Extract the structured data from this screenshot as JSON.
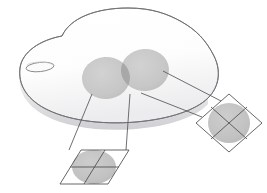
{
  "figure": {
    "background_color": "#ffffff",
    "width": 267,
    "height": 193
  },
  "colors": {
    "background": "#ffffff",
    "outline": "#6f6f72",
    "leader_line": "#55555a",
    "patch_fill": "#c9c9c9",
    "patch_overlap_fill": "#a8a8a8",
    "inset_circle_fill": "#c4c4c4",
    "inset_frame_stroke": "#4c4c50",
    "inset_grid_stroke": "#4c4c50",
    "surface_light": "#ffffff",
    "surface_shadow": "#d7d7da",
    "pore_stroke": "#7a7a7e"
  },
  "surface": {
    "name": "blob-surface",
    "shape": "irregular rounded blob, kidney-like, seen in oblique 3D perspective",
    "outline_path": "M 62 36 C 70 18, 96 8, 128 8 C 152 8, 168 14, 182 22 C 196 30, 206 40, 214 56 C 221 70, 220 86, 208 98 C 196 110, 170 119, 136 122 C 100 125, 66 120, 44 108 C 26 98, 18 84, 20 68 C 22 52, 40 40, 62 36 Z",
    "thickness_px": 12,
    "has_shading": true
  },
  "pore": {
    "name": "surface-pore",
    "shape": "ellipse",
    "cx": 40,
    "cy": 67,
    "rx": 14,
    "ry": 4.5,
    "rotation_deg": -6
  },
  "patches": [
    {
      "id": "patch-left",
      "name": "surface-patch-left",
      "cx": 106,
      "cy": 78,
      "rx": 24,
      "ry": 21,
      "rotation_deg": -4,
      "fill": "#c9c9c9"
    },
    {
      "id": "patch-right",
      "name": "surface-patch-right",
      "cx": 145,
      "cy": 70,
      "rx": 24,
      "ry": 21,
      "rotation_deg": -4,
      "fill": "#c9c9c9"
    }
  ],
  "patch_overlap": {
    "name": "patch-overlap-lens",
    "fill": "#a8a8a8",
    "description": "lens-shaped intersection of the two circular patches"
  },
  "insets": [
    {
      "id": "inset-bottom-left",
      "name": "inset-parallelogram",
      "frame_type": "parallelogram",
      "points": "60,184 81,150 129,150 108,184",
      "circle": {
        "cx": 94,
        "cy": 167,
        "rx": 22,
        "ry": 17,
        "fill": "#c4c4c4"
      },
      "grid_lines": [
        {
          "name": "inset-grid-line-horizontal",
          "x1": 70,
          "y1": 167,
          "x2": 119,
          "y2": 167
        },
        {
          "name": "inset-grid-line-slanted",
          "x1": 105,
          "y1": 150,
          "x2": 84,
          "y2": 184
        }
      ],
      "leaders": [
        {
          "name": "leader-line-left-patch",
          "x1": 92,
          "y1": 94,
          "x2": 69,
          "y2": 150
        },
        {
          "name": "leader-line-right-patch",
          "x1": 130,
          "y1": 94,
          "x2": 126,
          "y2": 150
        }
      ]
    },
    {
      "id": "inset-right",
      "name": "inset-diamond",
      "frame_type": "diamond",
      "points": "229,94 262,123 229,152 196,123",
      "circle": {
        "cx": 229,
        "cy": 123,
        "rx": 21,
        "ry": 20,
        "fill": "#c4c4c4"
      },
      "grid_lines": [
        {
          "name": "inset-grid-line-diagonal-a",
          "x1": 212,
          "y1": 108,
          "x2": 246,
          "y2": 138
        },
        {
          "name": "inset-grid-line-diagonal-b",
          "x1": 246,
          "y1": 108,
          "x2": 212,
          "y2": 138
        }
      ],
      "leaders": [
        {
          "name": "leader-line-upper",
          "x1": 163,
          "y1": 71,
          "x2": 221,
          "y2": 101
        },
        {
          "name": "leader-line-lower",
          "x1": 141,
          "y1": 93,
          "x2": 202,
          "y2": 117
        }
      ]
    }
  ]
}
